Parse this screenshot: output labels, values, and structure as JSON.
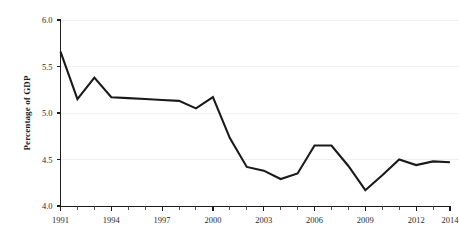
{
  "chart_data": {
    "type": "line",
    "title": "",
    "subtitle": "",
    "xlabel": "",
    "ylabel": "Percentage of GDP",
    "xlim": [
      1991,
      2014
    ],
    "ylim": [
      4.0,
      6.0
    ],
    "grid": true,
    "legend": "none",
    "x": [
      1991,
      1992,
      1993,
      1994,
      1995,
      1996,
      1997,
      1998,
      1999,
      2000,
      2001,
      2002,
      2003,
      2004,
      2005,
      2006,
      2007,
      2008,
      2009,
      2010,
      2011,
      2012,
      2013,
      2014
    ],
    "series": [
      {
        "name": "Percentage of GDP",
        "color": "#1a1a1a",
        "values": [
          5.66,
          5.15,
          5.38,
          5.17,
          5.16,
          5.15,
          5.14,
          5.13,
          5.05,
          5.17,
          4.73,
          4.42,
          4.38,
          4.29,
          4.35,
          4.65,
          4.65,
          4.43,
          4.17,
          4.33,
          4.5,
          4.44,
          4.48,
          4.47
        ]
      }
    ],
    "x_ticks_major": [
      1991,
      1994,
      1997,
      2000,
      2003,
      2006,
      2009,
      2012,
      2014
    ],
    "x_tick_labels": [
      "1991",
      "1994",
      "1997",
      "2000",
      "2003",
      "2006",
      "2009",
      "2012",
      "2014"
    ],
    "x_ticks_minor": [
      1992,
      1993,
      1995,
      1996,
      1998,
      1999,
      2001,
      2002,
      2004,
      2005,
      2007,
      2008,
      2010,
      2011,
      2013
    ],
    "y_ticks": [
      4.0,
      4.5,
      5.0,
      5.5,
      6.0
    ],
    "y_tick_labels": [
      "4.0",
      "4.5",
      "5.0",
      "5.5",
      "6.0"
    ]
  },
  "colors": {
    "background": "#ffffff",
    "line": "#1a1a1a",
    "axis": "#1c1c1c",
    "grid": "#f0f0f0",
    "text": "#1a1a1a"
  }
}
